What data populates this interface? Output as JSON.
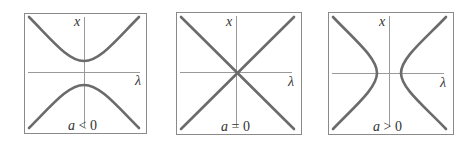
{
  "figure": {
    "panels": [
      {
        "id": "a-negative",
        "x_label": "x",
        "lambda_label": "λ",
        "caption_var": "a",
        "caption_op": " < ",
        "caption_val": "0",
        "shape": "hyperbola opening vertically (upper and lower branches)"
      },
      {
        "id": "a-zero",
        "x_label": "x",
        "lambda_label": "λ",
        "caption_var": "a",
        "caption_op": " = ",
        "caption_val": "0",
        "shape": "two crossing lines through origin"
      },
      {
        "id": "a-positive",
        "x_label": "x",
        "lambda_label": "λ",
        "caption_var": "a",
        "caption_op": " > ",
        "caption_val": "0",
        "shape": "hyperbola opening horizontally (left and right branches)"
      }
    ],
    "colors": {
      "curve": "#6b6b6b",
      "axis": "#9a9a9a",
      "frame": "#8a8a8a",
      "text": "#333333"
    }
  }
}
